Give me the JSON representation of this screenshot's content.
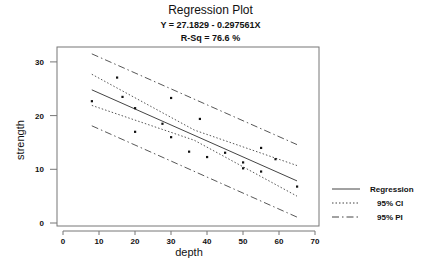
{
  "chart_data": {
    "type": "scatter",
    "title": "Regression Plot",
    "subtitle_equation": "Y = 27.1829 - 0.297561X",
    "subtitle_rsq": "R-Sq = 76.6 %",
    "xlabel": "depth",
    "ylabel": "strength",
    "xlim": [
      0,
      70
    ],
    "ylim": [
      0,
      30
    ],
    "xticks": [
      0,
      10,
      20,
      30,
      40,
      50,
      60,
      70
    ],
    "yticks": [
      0,
      10,
      20,
      30
    ],
    "grid": false,
    "legend_position": "right",
    "points": [
      {
        "x": 8,
        "y": 22.7
      },
      {
        "x": 15,
        "y": 27.1
      },
      {
        "x": 16.5,
        "y": 23.5
      },
      {
        "x": 20,
        "y": 21.4
      },
      {
        "x": 20,
        "y": 17.0
      },
      {
        "x": 27.6,
        "y": 18.5
      },
      {
        "x": 30,
        "y": 23.3
      },
      {
        "x": 30,
        "y": 16.0
      },
      {
        "x": 35,
        "y": 13.3
      },
      {
        "x": 38,
        "y": 19.4
      },
      {
        "x": 40,
        "y": 12.3
      },
      {
        "x": 45,
        "y": 13.1
      },
      {
        "x": 50,
        "y": 11.3
      },
      {
        "x": 50,
        "y": 10.2
      },
      {
        "x": 55,
        "y": 14.0
      },
      {
        "x": 55,
        "y": 9.6
      },
      {
        "x": 59,
        "y": 11.9
      },
      {
        "x": 65,
        "y": 6.8
      }
    ],
    "series": [
      {
        "name": "Regression",
        "style": "solid",
        "x": [
          8,
          65
        ],
        "y": [
          24.8,
          7.84
        ]
      },
      {
        "name": "95% CI",
        "style": "dotted",
        "upper": {
          "x": [
            8,
            36.5,
            65
          ],
          "y": [
            27.7,
            17.3,
            10.7
          ]
        },
        "lower": {
          "x": [
            8,
            36.5,
            65
          ],
          "y": [
            21.9,
            15.4,
            5.0
          ]
        }
      },
      {
        "name": "95% PI",
        "style": "dashdot",
        "upper": {
          "x": [
            8,
            65
          ],
          "y": [
            31.5,
            14.6
          ]
        },
        "lower": {
          "x": [
            8,
            65
          ],
          "y": [
            18.1,
            1.1
          ]
        }
      }
    ],
    "legend": [
      "Regression",
      "95% CI",
      "95% PI"
    ]
  },
  "colors": {
    "line": "#444444",
    "point": "#111111",
    "frame": "#777777"
  }
}
